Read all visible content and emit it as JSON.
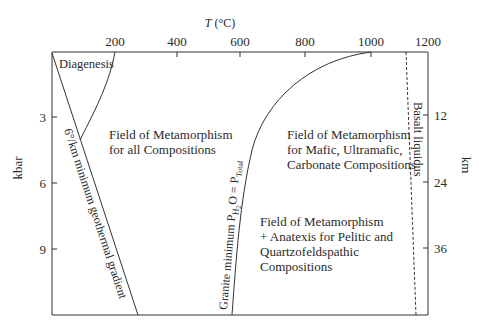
{
  "x_axis": {
    "label": "T (°C)",
    "label_italic": "T",
    "label_unit": "(°C)",
    "ticks": [
      "200",
      "400",
      "600",
      "800",
      "1000",
      "1200"
    ]
  },
  "y_axis_left": {
    "label": "kbar",
    "ticks": [
      "3",
      "6",
      "9"
    ]
  },
  "y_axis_right": {
    "label": "km",
    "ticks": [
      "12",
      "24",
      "36"
    ]
  },
  "curves": {
    "diagenesis": "Diagenesis",
    "geotherm": "6°/km minimum geothermal gradient",
    "granite": "Granite minimum P",
    "granite_sub_h2o": "H",
    "granite_sub_2": "2",
    "granite_o": "O = P",
    "granite_sub_total": "Total",
    "basalt": "Basalt liquidus"
  },
  "fields": {
    "all": [
      "Field of Metamorphism",
      "for all Compositions"
    ],
    "mafic": [
      "Field of Metamorphism",
      "for Mafic, Ultramafic,",
      "Carbonate Compositions"
    ],
    "anatexis": [
      "Field of Metamorphism",
      "+ Anatexis for Pelitic and",
      "Quartzofeldspathic",
      "Compositions"
    ]
  },
  "colors": {
    "line": "#333333",
    "text": "#2a2a2a",
    "background": "#ffffff"
  }
}
